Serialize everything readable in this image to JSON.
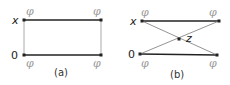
{
  "panels": [
    {
      "caption": "(a)",
      "left_labels": {
        "top": "x",
        "bottom": "0"
      },
      "corner_labels": {
        "top_left": "φ",
        "top_right": "φ",
        "bottom_left": "φ",
        "bottom_right": "φ"
      }
    },
    {
      "caption": "(b)",
      "left_labels": {
        "top": "x",
        "bottom": "0"
      },
      "center_label": "z",
      "corner_labels": {
        "top_left": "φ",
        "top_right": "φ",
        "bottom_left": "φ",
        "bottom_right": "φ"
      }
    }
  ],
  "colors": {
    "edge_dark": "#222222",
    "edge_light": "#9a9a9a",
    "phi": "#9a9a9a"
  }
}
